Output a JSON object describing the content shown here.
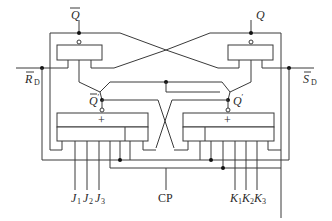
{
  "diagram": {
    "type": "master-slave JK flip-flop (TTL) logic circuit",
    "labels": {
      "q_bar": "Q",
      "q": "Q",
      "q_prime_bar": "Q",
      "q_prime_mark": "′",
      "q_prime": "Q",
      "rd_main": "R",
      "rd_sub": "D",
      "sd_main": "S",
      "sd_sub": "D",
      "j1_main": "J",
      "j1_sub": "1",
      "j2_main": "J",
      "j2_sub": "2",
      "j3_main": "J",
      "j3_sub": "3",
      "cp": "CP",
      "k1_main": "K",
      "k1_sub": "1",
      "k2_main": "K",
      "k2_sub": "2",
      "k3_main": "K",
      "k3_sub": "3",
      "plus_left": "+",
      "plus_right": "+"
    },
    "components": [
      "slave-latch-left-gate",
      "slave-latch-right-gate",
      "inverter-transistor-left",
      "inverter-transistor-right",
      "master-gate-left (AND-OR-INVERT, inputs J1 J2 J3)",
      "master-gate-right (AND-OR-INVERT, inputs K1 K2 K3)"
    ],
    "inputs": [
      "R̄D",
      "S̄D",
      "J1",
      "J2",
      "J3",
      "CP",
      "K1",
      "K2",
      "K3"
    ],
    "outputs": [
      "Q̄",
      "Q"
    ],
    "internal_nodes": [
      "Q̄′",
      "Q′"
    ]
  }
}
